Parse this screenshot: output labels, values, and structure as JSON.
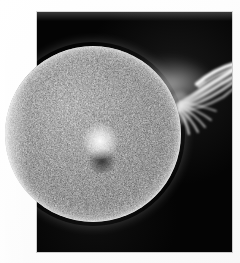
{
  "image": {
    "kind": "photograph",
    "subject": "solar-disc-with-erupting-prominence",
    "caption": "",
    "title": "",
    "credit": "",
    "width": 240,
    "height": 263
  },
  "canvas": {
    "background_color": "#fdfdfd",
    "paper_color": "#ffffff"
  },
  "plate": {
    "name": "photographic-plate",
    "background_color": "#050505",
    "border_color": "#9a9a9a",
    "x": 37,
    "y": 12,
    "width": 195,
    "height": 240
  },
  "disc": {
    "name": "solar-disc",
    "center_x": 93,
    "center_y": 134,
    "radius": 88,
    "base_color": "#b9b9b9",
    "highlight_color": "#f5f5f5",
    "speckle_color": "#2a2a2a",
    "limb_color": "#787878",
    "description": "mottled granular sphere, brighter toward upper-left, dark dense speckling across the face"
  },
  "features": [
    {
      "name": "bright-plage-spot",
      "x": 116,
      "y": 118,
      "size": 17,
      "color": "#ffffff"
    },
    {
      "name": "dark-sunspot-patch",
      "x": 118,
      "y": 131,
      "size": 13,
      "color": "#3c3c3c"
    },
    {
      "name": "dark-filament-band",
      "x": 70,
      "y": 92,
      "size": 46,
      "color": "#323232"
    }
  ],
  "prominence": {
    "name": "erupting-prominence",
    "origin_x": 177,
    "origin_y": 108,
    "tip_x": 231,
    "tip_y": 69,
    "color": "#f2f2f2",
    "filament_count": 9,
    "description": "fan of bright filaments sweeping up and to the right from the limb, ending in a dense curved bright arc near the plate's right edge"
  },
  "colors": {
    "black": "#050505",
    "white": "#ffffff",
    "mid_gray": "#b9b9b9",
    "dark_gray": "#2a2a2a"
  }
}
